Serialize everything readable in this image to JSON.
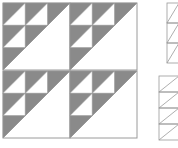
{
  "diagram": {
    "colors": {
      "dark": "#8a8a8a",
      "light": "#ffffff",
      "line": "#9a9a9a"
    },
    "blocks": [
      {
        "x": 3,
        "y": 3
      },
      {
        "x": 70,
        "y": 3
      },
      {
        "x": 3,
        "y": 71
      },
      {
        "x": 70,
        "y": 71
      }
    ],
    "block_size": 67,
    "strips": [
      {
        "x": 167,
        "y": 3,
        "width": 12,
        "height": 60,
        "cells": 3
      },
      {
        "x": 159,
        "y": 76,
        "width": 20,
        "height": 64,
        "cells": 4
      }
    ]
  }
}
